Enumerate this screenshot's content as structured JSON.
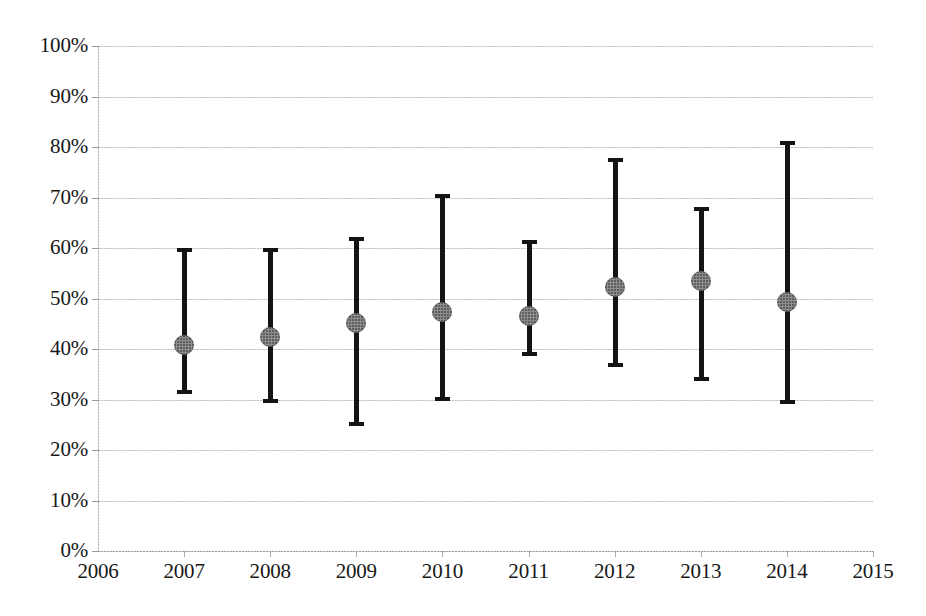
{
  "chart_data": {
    "type": "scatter",
    "title": "",
    "subtitle": "",
    "xlabel": "",
    "ylabel": "",
    "grid": true,
    "legend": "none",
    "xlim": [
      2006,
      2015
    ],
    "ylim": [
      0,
      100
    ],
    "y_tick_labels": [
      "100%",
      "90%",
      "80%",
      "70%",
      "60%",
      "50%",
      "40%",
      "30%",
      "20%",
      "10%",
      "0%"
    ],
    "y_tick_values": [
      100,
      90,
      80,
      70,
      60,
      50,
      40,
      30,
      20,
      10,
      0
    ],
    "x_tick_labels": [
      "2006",
      "2007",
      "2008",
      "2009",
      "2010",
      "2011",
      "2012",
      "2013",
      "2014",
      "2015"
    ],
    "x_tick_values": [
      2006,
      2007,
      2008,
      2009,
      2010,
      2011,
      2012,
      2013,
      2014,
      2015
    ],
    "series": [
      {
        "name": "estimate",
        "marker": "circle",
        "marker_color": "#8e8e8e",
        "errorbar_color": "#141414",
        "x": [
          2007,
          2008,
          2009,
          2010,
          2011,
          2012,
          2013,
          2014
        ],
        "values": [
          40.8,
          42.3,
          45.1,
          47.3,
          46.5,
          52.3,
          53.4,
          49.4
        ],
        "err_low": [
          31.1,
          29.4,
          24.7,
          29.7,
          38.7,
          36.5,
          33.7,
          29.1
        ],
        "err_high": [
          60.0,
          60.0,
          62.1,
          70.7,
          61.6,
          77.8,
          68.2,
          81.1
        ]
      }
    ],
    "points": [
      {
        "year": "2007",
        "value": 40.8,
        "low": 31.1,
        "high": 60.0
      },
      {
        "year": "2008",
        "value": 42.3,
        "low": 29.4,
        "high": 60.0
      },
      {
        "year": "2009",
        "value": 45.1,
        "low": 24.7,
        "high": 62.1
      },
      {
        "year": "2010",
        "value": 47.3,
        "low": 29.7,
        "high": 70.7
      },
      {
        "year": "2011",
        "value": 46.5,
        "low": 38.7,
        "high": 61.6
      },
      {
        "year": "2012",
        "value": 52.3,
        "low": 36.5,
        "high": 77.8
      },
      {
        "year": "2013",
        "value": 53.4,
        "low": 33.7,
        "high": 68.2
      },
      {
        "year": "2014",
        "value": 49.4,
        "low": 29.1,
        "high": 81.1
      }
    ],
    "colors": {
      "marker": "#8e8e8e",
      "errorbar": "#141414",
      "gridline": "#bfbfbf",
      "text": "#181818",
      "background": "#ffffff"
    }
  }
}
